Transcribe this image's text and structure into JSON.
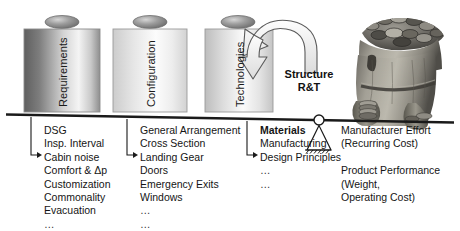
{
  "diagram": {
    "pillars": [
      {
        "label": "Requirements",
        "shade": "dark"
      },
      {
        "label": "Configuration",
        "shade": "light"
      },
      {
        "label": "Technologies",
        "shade": "mid"
      }
    ],
    "arrow_label": {
      "line1": "Structure",
      "line2": "R&T"
    },
    "columns": [
      {
        "name": "requirements-items",
        "items": [
          {
            "text": "DSG",
            "bold": false,
            "dots": false
          },
          {
            "text": "Insp. Interval",
            "bold": false,
            "dots": false
          },
          {
            "text": "Cabin noise",
            "bold": false,
            "dots": false
          },
          {
            "text": "Comfort & Δp",
            "bold": false,
            "dots": false
          },
          {
            "text": "Customization",
            "bold": false,
            "dots": false
          },
          {
            "text": "Commonality",
            "bold": false,
            "dots": false
          },
          {
            "text": "Evacuation",
            "bold": false,
            "dots": false
          },
          {
            "text": "…",
            "bold": false,
            "dots": true
          }
        ]
      },
      {
        "name": "configuration-items",
        "items": [
          {
            "text": "General Arrangement",
            "bold": false,
            "dots": false
          },
          {
            "text": "Cross Section",
            "bold": false,
            "dots": false
          },
          {
            "text": "Landing Gear",
            "bold": false,
            "dots": false
          },
          {
            "text": "Doors",
            "bold": false,
            "dots": false
          },
          {
            "text": "Emergency Exits",
            "bold": false,
            "dots": false
          },
          {
            "text": "Windows",
            "bold": false,
            "dots": false
          },
          {
            "text": "…",
            "bold": false,
            "dots": true
          },
          {
            "text": "…",
            "bold": false,
            "dots": true
          }
        ]
      },
      {
        "name": "technologies-items",
        "items": [
          {
            "text": "Materials",
            "bold": true,
            "dots": false
          },
          {
            "text": "Manufacturing",
            "bold": false,
            "dots": false
          },
          {
            "text": "Design Principles",
            "bold": false,
            "dots": false
          },
          {
            "text": "…",
            "bold": false,
            "dots": true
          },
          {
            "text": "…",
            "bold": false,
            "dots": true
          }
        ]
      }
    ],
    "outcomes": [
      {
        "text": "Manufacturer Effort"
      },
      {
        "text": "(Recurring Cost)"
      },
      {
        "text": ""
      },
      {
        "text": "Product Performance"
      },
      {
        "text": "(Weight,"
      },
      {
        "text": "Operating Cost)"
      }
    ],
    "colors": {
      "ink": "#151515",
      "beam": "#1a1a1a",
      "pillar_outline": "#8a8a8a",
      "pillar_dark_a": "#6e6e6e",
      "pillar_dark_b": "#f2f2f2",
      "pillar_light_a": "#d9d9d9",
      "pillar_light_b": "#fbfbfb",
      "cap_fill": "#9a9a9a",
      "arrow_fill": "#ececec",
      "arrow_stroke": "#4a4a4a",
      "sack_body": "#8d8a82",
      "sack_dark": "#4a4844",
      "coin": "#6b6862"
    }
  }
}
